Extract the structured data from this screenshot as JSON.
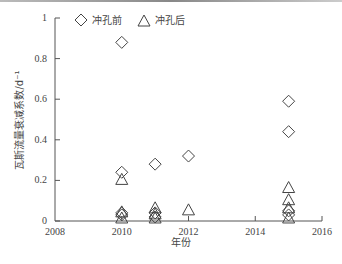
{
  "chart_data": {
    "type": "scatter",
    "title": "",
    "xlabel": "年份",
    "ylabel": "瓦斯流量衰减系数/d⁻¹",
    "xlim": [
      2008,
      2016
    ],
    "ylim": [
      0,
      1
    ],
    "xticks": [
      2008,
      2010,
      2012,
      2014,
      2016
    ],
    "yticks": [
      0,
      0.2,
      0.4,
      0.6,
      0.8,
      1
    ],
    "ytick_labels": [
      "0",
      "0.2",
      "0.4",
      "0.6",
      "0.8",
      "1"
    ],
    "xtick_labels": [
      "2008",
      "2010",
      "2012",
      "2014",
      "2016"
    ],
    "grid": false,
    "legend_position": "top-left-inside",
    "series": [
      {
        "name": "冲孔前",
        "marker": "diamond",
        "points": [
          {
            "x": 2010,
            "y": 0.88
          },
          {
            "x": 2010,
            "y": 0.24
          },
          {
            "x": 2010,
            "y": 0.04
          },
          {
            "x": 2010,
            "y": 0.03
          },
          {
            "x": 2011,
            "y": 0.28
          },
          {
            "x": 2011,
            "y": 0.04
          },
          {
            "x": 2011,
            "y": 0.02
          },
          {
            "x": 2012,
            "y": 0.32
          },
          {
            "x": 2015,
            "y": 0.59
          },
          {
            "x": 2015,
            "y": 0.44
          },
          {
            "x": 2015,
            "y": 0.05
          },
          {
            "x": 2015,
            "y": 0.03
          }
        ]
      },
      {
        "name": "冲孔后",
        "marker": "triangle",
        "points": [
          {
            "x": 2010,
            "y": 0.2
          },
          {
            "x": 2010,
            "y": 0.04
          },
          {
            "x": 2010,
            "y": 0.01
          },
          {
            "x": 2011,
            "y": 0.06
          },
          {
            "x": 2011,
            "y": 0.03
          },
          {
            "x": 2011,
            "y": 0.01
          },
          {
            "x": 2012,
            "y": 0.05
          },
          {
            "x": 2015,
            "y": 0.16
          },
          {
            "x": 2015,
            "y": 0.1
          },
          {
            "x": 2015,
            "y": 0.06
          },
          {
            "x": 2015,
            "y": 0.01
          }
        ]
      }
    ]
  },
  "legend": {
    "items": [
      {
        "label": "冲孔前",
        "icon": "diamond-icon"
      },
      {
        "label": "冲孔后",
        "icon": "triangle-icon"
      }
    ]
  },
  "colors": {
    "axis": "#555555",
    "marker_stroke": "#444444"
  }
}
